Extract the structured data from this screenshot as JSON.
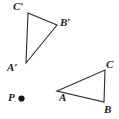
{
  "figure": {
    "background_color": "#ffffff",
    "stroke_color": "#2b2b2b",
    "stroke_width": 1.1,
    "width": 119,
    "height": 119
  },
  "shapes": {
    "image_triangle": {
      "name": "triangle-a-prime-b-prime-c-prime",
      "points": "28,13 57,25 26,63",
      "vertices": [
        {
          "id": "C'",
          "label": "C′",
          "x": 28,
          "y": 13,
          "label_x": 13,
          "label_y": 1
        },
        {
          "id": "B'",
          "label": "B′",
          "x": 57,
          "y": 25,
          "label_x": 60,
          "label_y": 17
        },
        {
          "id": "A'",
          "label": "A′",
          "x": 26,
          "y": 63,
          "label_x": 7,
          "label_y": 62
        }
      ]
    },
    "preimage_triangle": {
      "name": "triangle-a-b-c",
      "points": "57,91 105,70 104,102",
      "vertices": [
        {
          "id": "C",
          "label": "C",
          "x": 105,
          "y": 70,
          "label_x": 106,
          "label_y": 59
        },
        {
          "id": "A",
          "label": "A",
          "x": 57,
          "y": 91,
          "label_x": 59,
          "label_y": 92
        },
        {
          "id": "B",
          "label": "B",
          "x": 104,
          "y": 102,
          "label_x": 104,
          "label_y": 104
        }
      ]
    }
  },
  "center_point": {
    "name": "point-p",
    "label": "P",
    "label_x": 8,
    "label_y": 92,
    "dot_x": 21.5,
    "dot_y": 98.5,
    "dot_radius": 3.1,
    "dot_color": "#141414"
  }
}
